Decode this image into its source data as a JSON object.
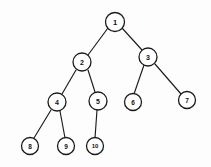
{
  "figure": {
    "name": "binary-tree-diagram",
    "background_color": "#fdfdfd",
    "node_fill_color": "#ffffff",
    "node_stroke_color": "#1b1b1b",
    "edge_color": "#1c1c1c",
    "label_color": "#111111"
  },
  "nodes": [
    {
      "id": "n1",
      "label": "1",
      "x": 115,
      "y": 22,
      "r": 9.5,
      "font_size": 7.5
    },
    {
      "id": "n2",
      "label": "2",
      "x": 82,
      "y": 62,
      "r": 9.0,
      "font_size": 7.0
    },
    {
      "id": "n3",
      "label": "3",
      "x": 148,
      "y": 57,
      "r": 9.0,
      "font_size": 7.0
    },
    {
      "id": "n4",
      "label": "4",
      "x": 57,
      "y": 102,
      "r": 9.0,
      "font_size": 7.0
    },
    {
      "id": "n5",
      "label": "5",
      "x": 98,
      "y": 101,
      "r": 9.0,
      "font_size": 7.0
    },
    {
      "id": "n6",
      "label": "6",
      "x": 133,
      "y": 102,
      "r": 8.5,
      "font_size": 6.5
    },
    {
      "id": "n7",
      "label": "7",
      "x": 187,
      "y": 100,
      "r": 8.5,
      "font_size": 6.5
    },
    {
      "id": "n8",
      "label": "8",
      "x": 30,
      "y": 146,
      "r": 8.5,
      "font_size": 6.5
    },
    {
      "id": "n9",
      "label": "9",
      "x": 66,
      "y": 146,
      "r": 8.5,
      "font_size": 6.5
    },
    {
      "id": "n10",
      "label": "10",
      "x": 95,
      "y": 146,
      "r": 8.5,
      "font_size": 6.0
    }
  ],
  "edges": [
    {
      "id": "e1-2",
      "from": "n1",
      "to": "n2",
      "x1": 108,
      "y1": 28,
      "x2": 88,
      "y2": 55
    },
    {
      "id": "e1-3",
      "from": "n1",
      "to": "n3",
      "x1": 122,
      "y1": 28,
      "x2": 142,
      "y2": 50
    },
    {
      "id": "e2-4",
      "from": "n2",
      "to": "n4",
      "x1": 76,
      "y1": 70,
      "x2": 62,
      "y2": 94
    },
    {
      "id": "e2-5",
      "from": "n2",
      "to": "n5",
      "x1": 88,
      "y1": 70,
      "x2": 95,
      "y2": 92
    },
    {
      "id": "e3-6",
      "from": "n3",
      "to": "n6",
      "x1": 144,
      "y1": 65,
      "x2": 134,
      "y2": 94
    },
    {
      "id": "e3-7",
      "from": "n3",
      "to": "n7",
      "x1": 155,
      "y1": 64,
      "x2": 181,
      "y2": 94
    },
    {
      "id": "e4-8",
      "from": "n4",
      "to": "n8",
      "x1": 51,
      "y1": 110,
      "x2": 34,
      "y2": 138
    },
    {
      "id": "e4-9",
      "from": "n4",
      "to": "n9",
      "x1": 60,
      "y1": 111,
      "x2": 65,
      "y2": 138
    },
    {
      "id": "e5-10",
      "from": "n5",
      "to": "n10",
      "x1": 97,
      "y1": 110,
      "x2": 95,
      "y2": 138
    }
  ]
}
